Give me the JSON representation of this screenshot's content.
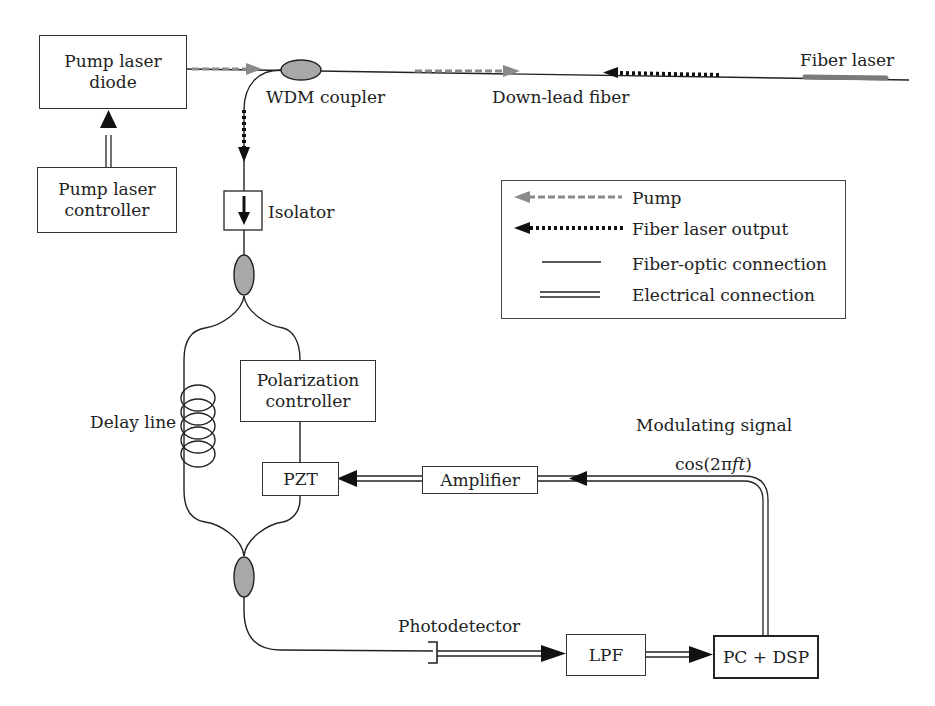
{
  "diagram": {
    "title": "",
    "components": {
      "pump_laser_diode": "Pump laser\ndiode",
      "pump_laser_controller": "Pump laser\ncontroller",
      "isolator": "Isolator",
      "wdm_coupler": "WDM coupler",
      "down_lead_fiber": "Down-lead fiber",
      "fiber_laser": "Fiber laser",
      "polarization_controller": "Polarization\ncontroller",
      "delay_line": "Delay line",
      "pzt": "PZT",
      "amplifier": "Amplifier",
      "modulating_signal": "Modulating signal",
      "modulating_formula_prefix": "cos(2π",
      "modulating_formula_italic": "ft",
      "modulating_formula_suffix": ")",
      "photodetector": "Photodetector",
      "lpf": "LPF",
      "pc_dsp": "PC + DSP"
    },
    "legend": {
      "items": [
        {
          "label": "Pump",
          "style": "gray-dashed-arrow"
        },
        {
          "label": "Fiber laser output",
          "style": "black-dotted-arrow"
        },
        {
          "label": "Fiber-optic connection",
          "style": "single-line"
        },
        {
          "label": "Electrical connection",
          "style": "double-line"
        }
      ]
    },
    "colors": {
      "line": "#222222",
      "pump": "#8a8a8a",
      "coupler_fill": "#a8a8a8",
      "fiber_laser_fill": "#7a7a7a"
    }
  }
}
